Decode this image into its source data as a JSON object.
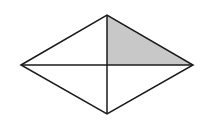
{
  "diagram": {
    "type": "rhombus-with-diagonals",
    "vertices": {
      "left": [
        21,
        65
      ],
      "top": [
        107,
        15
      ],
      "right": [
        193,
        65
      ],
      "bottom": [
        107,
        114
      ],
      "center": [
        107,
        65
      ]
    },
    "shaded_region": "upper-right triangle",
    "colors": {
      "stroke": "#1a1a1a",
      "shade": "#c8c8c8",
      "background": "#ffffff"
    }
  }
}
